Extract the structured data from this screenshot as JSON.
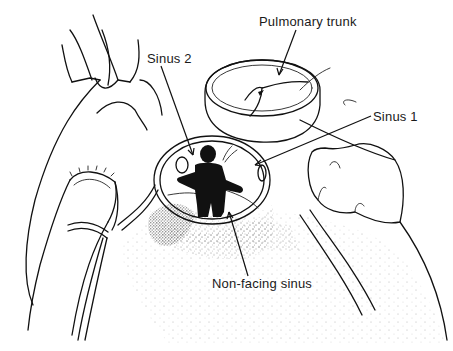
{
  "figure": {
    "type": "anatomical line illustration",
    "colors": {
      "ink": "#111111",
      "background": "#ffffff",
      "stipple": "#333333"
    }
  },
  "labels": {
    "pulmonary_trunk": "Pulmonary trunk",
    "sinus_1": "Sinus 1",
    "sinus_2": "Sinus 2",
    "non_facing_sinus": "Non-facing sinus"
  }
}
